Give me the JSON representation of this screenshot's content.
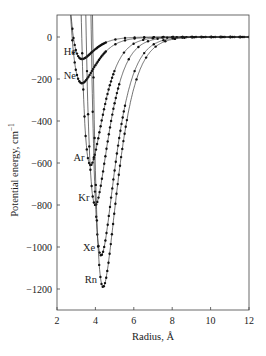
{
  "chart_data": {
    "type": "line",
    "title": "",
    "xlabel": "Radius, Å",
    "ylabel": "Potential energy, cm",
    "ylabel_superscript": "−1",
    "xlim": [
      2,
      12
    ],
    "ylim": [
      -1300,
      100
    ],
    "xticks": [
      2,
      4,
      6,
      8,
      10,
      12
    ],
    "yticks": [
      0,
      -200,
      -400,
      -600,
      -800,
      -1000,
      -1200
    ],
    "grid": false,
    "legend": "inline labels left of each curve minimum",
    "series": [
      {
        "name": "He",
        "r_min": 3.3,
        "depth": 105,
        "alpha": 1.55,
        "x": [
          2.9,
          3.0,
          3.1,
          3.2,
          3.3,
          3.5,
          3.8,
          4.2,
          5,
          6,
          8,
          10,
          12
        ],
        "values": [
          100,
          20,
          -60,
          -95,
          -105,
          -98,
          -80,
          -60,
          -32,
          -15,
          -4,
          -1,
          0
        ]
      },
      {
        "name": "Ne",
        "r_min": 3.3,
        "depth": 220,
        "alpha": 1.35,
        "x": [
          3.0,
          3.1,
          3.2,
          3.3,
          3.5,
          3.8,
          4.2,
          5,
          6,
          8,
          10,
          12
        ],
        "values": [
          40,
          -120,
          -200,
          -220,
          -205,
          -170,
          -130,
          -75,
          -38,
          -10,
          -3,
          0
        ]
      },
      {
        "name": "Ar",
        "r_min": 3.75,
        "depth": 610,
        "alpha": 1.5,
        "x": [
          3.3,
          3.4,
          3.5,
          3.6,
          3.75,
          4.0,
          4.5,
          5,
          6,
          8,
          10,
          12
        ],
        "values": [
          150,
          -150,
          -380,
          -540,
          -610,
          -570,
          -410,
          -270,
          -110,
          -25,
          -6,
          -1
        ]
      },
      {
        "name": "Kr",
        "r_min": 4.0,
        "depth": 800,
        "alpha": 1.45,
        "x": [
          3.5,
          3.6,
          3.7,
          3.8,
          4.0,
          4.3,
          4.8,
          5.5,
          6.5,
          8,
          10,
          12
        ],
        "values": [
          100,
          -250,
          -520,
          -700,
          -800,
          -745,
          -560,
          -330,
          -150,
          -45,
          -10,
          -2
        ]
      },
      {
        "name": "Xe",
        "r_min": 4.3,
        "depth": 1040,
        "alpha": 1.35,
        "x": [
          3.7,
          3.8,
          3.9,
          4.0,
          4.3,
          4.6,
          5.1,
          5.8,
          7,
          8,
          10,
          12
        ],
        "values": [
          150,
          -270,
          -620,
          -860,
          -1040,
          -970,
          -740,
          -450,
          -180,
          -80,
          -18,
          -3
        ]
      },
      {
        "name": "Rn",
        "r_min": 4.4,
        "depth": 1190,
        "alpha": 1.3,
        "x": [
          3.8,
          3.9,
          4.0,
          4.2,
          4.4,
          4.7,
          5.2,
          6,
          7,
          8,
          10,
          12
        ],
        "values": [
          100,
          -320,
          -700,
          -1080,
          -1190,
          -1120,
          -860,
          -500,
          -240,
          -110,
          -25,
          -4
        ]
      }
    ]
  },
  "labels": {
    "xlabel": "Radius, Å",
    "ylabel": "Potential energy, cm",
    "ylabel_sup": "−1"
  }
}
